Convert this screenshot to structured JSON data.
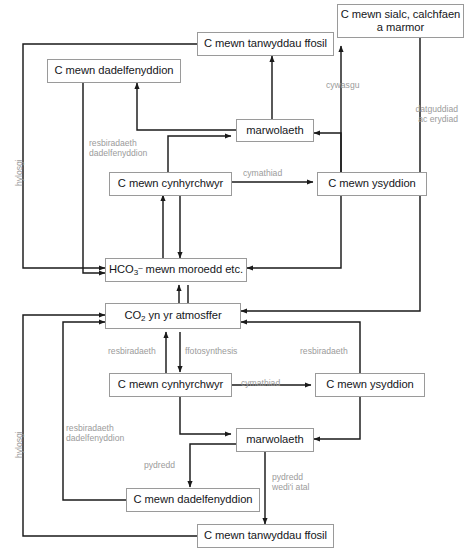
{
  "diagram": {
    "language": "cy",
    "background_color": "#ffffff",
    "box_border_color": "#9a9a9a",
    "arrow_color": "#1a1a1a",
    "label_color": "#9b9b9b",
    "nodes": {
      "chalk": {
        "line1": "C mewn sialc, calchfaen",
        "line2": "a marmor"
      },
      "fossil_top": {
        "label": "C mewn tanwyddau ffosil"
      },
      "decomposers_top": {
        "label": "C mewn dadelfenyddion"
      },
      "death_top": {
        "label": "marwolaeth"
      },
      "producers_top": {
        "label": "C mewn cynhyrchwyr"
      },
      "consumers_top": {
        "label": "C mewn ysyddion"
      },
      "bicarbonate": {
        "prefix": "HCO",
        "sub": "3",
        "sup": "–",
        "suffix": " mewn moroedd etc."
      },
      "atmosphere": {
        "prefix": "CO",
        "sub": "2",
        "suffix": " yn yr atmosffer"
      },
      "producers_bottom": {
        "label": "C mewn cynhyrchwyr"
      },
      "consumers_bottom": {
        "label": "C mewn ysyddion"
      },
      "death_bottom": {
        "label": "marwolaeth"
      },
      "decomposers_bottom": {
        "label": "C mewn dadelfenyddion"
      },
      "fossil_bottom": {
        "label": "C mewn tanwyddau ffosil"
      }
    },
    "edge_labels": {
      "hylosgi_top": "hylosgi",
      "hylosgi_bottom": "hylosgi",
      "resbiradaeth_dadelfenyddion_top_l1": "resbiradaeth",
      "resbiradaeth_dadelfenyddion_top_l2": "dadelfenyddion",
      "cymathiad_top": "cymathiad",
      "cywasgu": "cywasgu",
      "datguddiad_l1": "datguddiad",
      "datguddiad_l2": "ac erydiad",
      "resbiradaeth_bottom_left": "resbiradaeth",
      "ffotosynthesis": "ffotosynthesis",
      "resbiradaeth_bottom_right": "resbiradaeth",
      "cymathiad_bottom": "cymathiad",
      "resbiradaeth_dadelf_bottom_l1": "resbiradaeth",
      "resbiradaeth_dadelf_bottom_l2": "dadelfenyddion",
      "pydredd": "pydredd",
      "pydredd_atal_l1": "pydredd",
      "pydredd_atal_l2": "wedi'i atal"
    }
  }
}
